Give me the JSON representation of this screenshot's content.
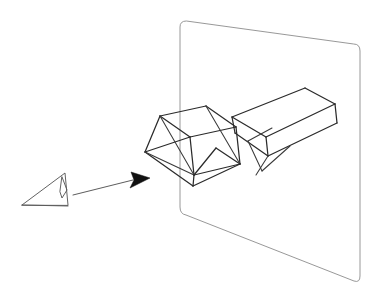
{
  "figure": {
    "background_color": "#ffffff",
    "width": 384,
    "height": 303
  },
  "colors": {
    "plane_stroke": "#8c8c8c",
    "wireframe_stroke": "#2b2b2b",
    "wireframe_thin_stroke": "#3a3a3a",
    "eye_stroke": "#5a5a5a",
    "ray_stroke": "#4a4a4a",
    "arrow_fill": "#111111"
  },
  "elements": {
    "eye": {
      "name": "eye-viewpoint",
      "outline": "M 22,205 L 65,173 L 68,205 Z",
      "pupil": "M 62,177 L 67,190 L 62,198 L 60,192 Z",
      "base": "M 22,205 L 68,206"
    },
    "view_ray": {
      "name": "view-direction-ray",
      "line": "M 73,195 L 133,180",
      "arrow_head": "M 131,172 L 150,178 L 130,188 L 134,180 Z"
    },
    "image_plane": {
      "name": "image-plane",
      "path": "M 186,21 Q 180,21 180,27 L 180,207 Q 180,214 186,215 L 354,281 Q 360,283 360,276 L 360,51 Q 360,44 354,44 Z",
      "corner_radius": 6
    },
    "box_left": {
      "name": "wireframe-box-left",
      "edges": [
        "M 160,116 L 206,106",
        "M 206,106 L 236,127",
        "M 236,127 L 190,137",
        "M 190,137 L 160,116",
        "M 145,152 L 190,137",
        "M 145,152 L 160,116",
        "M 190,137 L 194,175",
        "M 236,127 L 240,164",
        "M 145,152 L 193,186",
        "M 193,186 L 240,164",
        "M 194,175 L 193,186",
        "M 160,116 L 194,175",
        "M 206,106 L 240,164",
        "M 194,175 L 240,164",
        "M 145,152 L 194,175",
        "M 216,148 L 240,164",
        "M 216,148 L 194,175"
      ]
    },
    "box_right": {
      "name": "wireframe-box-right",
      "edges": [
        "M 232,117 L 305,88",
        "M 305,88 L 335,104",
        "M 335,104 L 266,137",
        "M 266,137 L 232,117",
        "M 232,117 L 235,133",
        "M 266,137 L 268,156",
        "M 335,104 L 337,123",
        "M 235,133 L 268,156",
        "M 268,156 L 337,123",
        "M 248,141 L 262,171",
        "M 262,171 L 290,146",
        "M 248,141 L 272,128",
        "M 256,175 L 268,156"
      ]
    }
  },
  "labels": {
    "eye_label": "",
    "plane_label": "",
    "box_label": ""
  }
}
